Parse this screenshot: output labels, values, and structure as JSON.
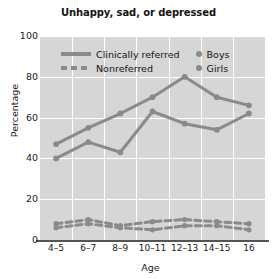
{
  "chart_data": {
    "type": "line",
    "title": "Unhappy, sad, or depressed",
    "xlabel": "Age",
    "ylabel": "Percentage",
    "categories": [
      "4–5",
      "6–7",
      "8–9",
      "10–11",
      "12–13",
      "14–15",
      "16"
    ],
    "ylim": [
      0,
      100
    ],
    "yticks": [
      0,
      20,
      40,
      60,
      80,
      100
    ],
    "grid": true,
    "legend_position": "inside-top-left",
    "series": [
      {
        "name": "Clinically referred Boys",
        "group": "Clinically referred",
        "sex": "Boys",
        "style": "solid",
        "values": [
          47,
          55,
          62,
          70,
          80,
          70,
          66
        ]
      },
      {
        "name": "Clinically referred Girls",
        "group": "Clinically referred",
        "sex": "Girls",
        "style": "solid",
        "values": [
          40,
          48,
          43,
          63,
          57,
          54,
          62
        ]
      },
      {
        "name": "Nonreferred Boys",
        "group": "Nonreferred",
        "sex": "Boys",
        "style": "dashed",
        "values": [
          8,
          10,
          7,
          9,
          10,
          9,
          8
        ]
      },
      {
        "name": "Nonreferred Girls",
        "group": "Nonreferred",
        "sex": "Girls",
        "style": "dashed",
        "values": [
          6,
          8,
          6,
          5,
          7,
          7,
          5
        ]
      }
    ],
    "colors": {
      "line": "#8a8a8a",
      "plot_background": "#d6d6d6",
      "grid": "#ffffff",
      "text": "#141414"
    }
  },
  "legend": {
    "items": [
      {
        "label": "Clinically referred",
        "marker": "solid-line"
      },
      {
        "label": "Nonreferred",
        "marker": "dashed-line"
      },
      {
        "label": "Boys",
        "marker": "dot"
      },
      {
        "label": "Girls",
        "marker": "dot"
      }
    ]
  }
}
